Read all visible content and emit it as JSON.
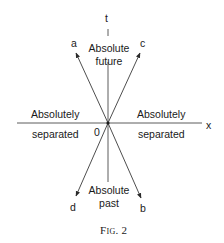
{
  "axes": {
    "time_label": "t",
    "space_label": "x",
    "origin_label": "0"
  },
  "worldlines": {
    "a": "a",
    "b": "b",
    "c": "c",
    "d": "d"
  },
  "regions": {
    "future_line1": "Absolute",
    "future_line2": "future",
    "past_line1": "Absolute",
    "past_line2": "past",
    "left_line1": "Absolutely",
    "left_line2": "separated",
    "right_line1": "Absolutely",
    "right_line2": "separated"
  },
  "caption": "Fig. 2",
  "colors": {
    "line": "#3a3a3a",
    "text": "#1a1a1a"
  }
}
